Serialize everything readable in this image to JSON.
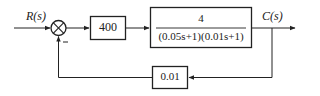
{
  "diagram": {
    "type": "feedback control block diagram",
    "input": {
      "label": "R(s)"
    },
    "output": {
      "label": "C(s)"
    },
    "summing_junction": {
      "feedback_sign": "−"
    },
    "forward_blocks": [
      {
        "label": "400"
      },
      {
        "numerator": "4",
        "denominator": "(0.05s+1)(0.01s+1)"
      }
    ],
    "feedback_block": {
      "label": "0.01"
    },
    "colors": {
      "line": "#222222",
      "background": "#ffffff"
    }
  }
}
